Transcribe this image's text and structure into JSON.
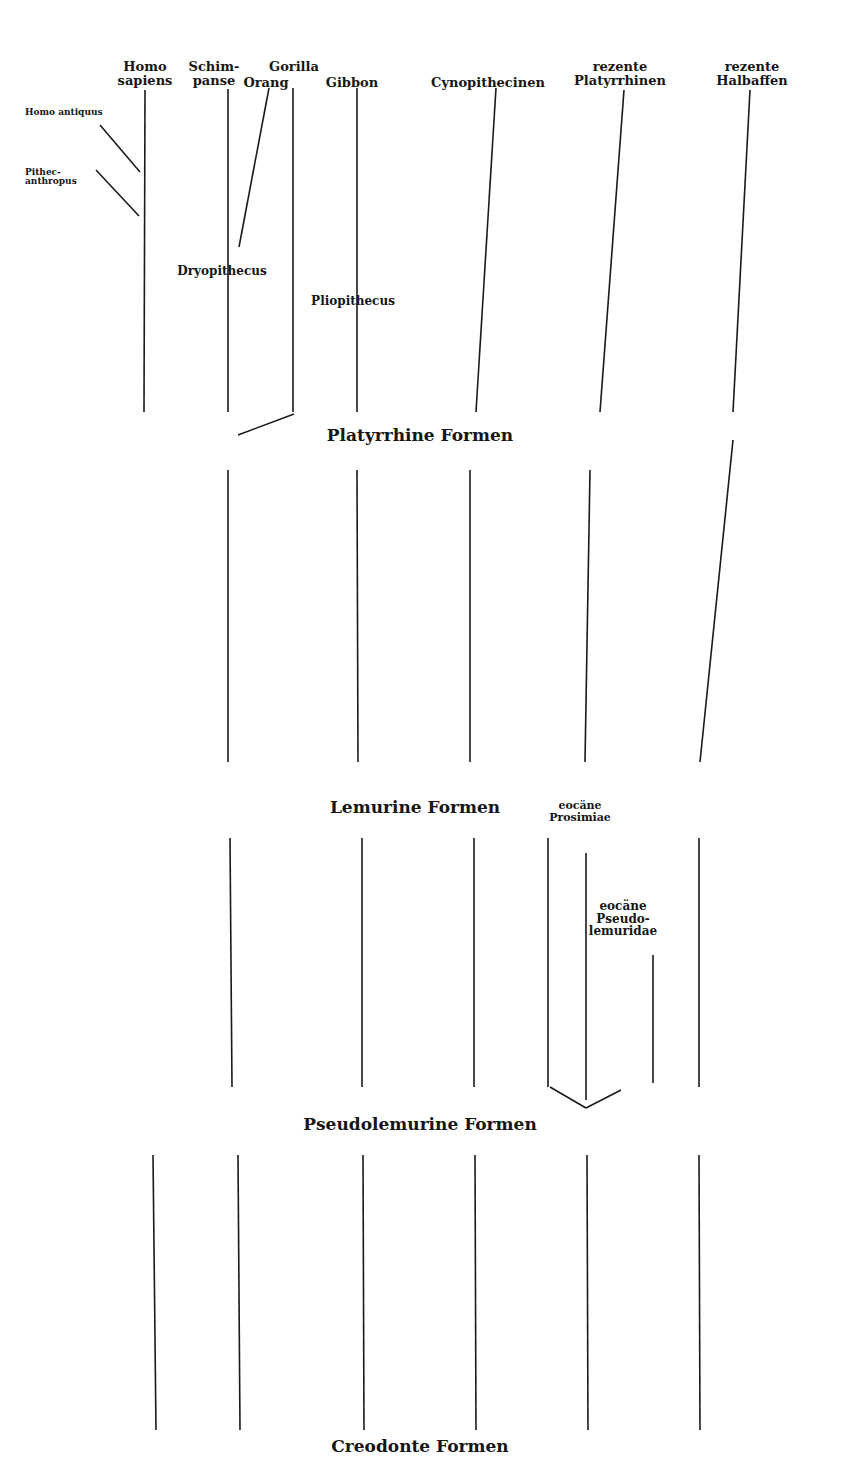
{
  "diagram": {
    "type": "phylogenetic-tree",
    "line_color": "#1a1a1a",
    "top_labels": [
      {
        "id": "homo-sapiens",
        "lines": [
          "Homo",
          "sapiens"
        ],
        "x": 145,
        "y": 60
      },
      {
        "id": "schimpanse",
        "lines": [
          "Schim-",
          "panse"
        ],
        "x": 214,
        "y": 60
      },
      {
        "id": "gorilla",
        "lines": [
          "Gorilla"
        ],
        "x": 294,
        "y": 60
      },
      {
        "id": "orang",
        "lines": [
          "Orang"
        ],
        "x": 266,
        "y": 76
      },
      {
        "id": "gibbon",
        "lines": [
          "Gibbon"
        ],
        "x": 352,
        "y": 76
      },
      {
        "id": "cynopithecinen",
        "lines": [
          "Cynopithecinen"
        ],
        "x": 488,
        "y": 76
      },
      {
        "id": "rezente-platyrrhinen",
        "lines": [
          "rezente",
          "Platyrrhinen"
        ],
        "x": 620,
        "y": 60
      },
      {
        "id": "rezente-halbaffen",
        "lines": [
          "rezente",
          "Halbaffen"
        ],
        "x": 752,
        "y": 60
      }
    ],
    "side_labels": [
      {
        "id": "homo-antiquus",
        "lines": [
          "Homo antiquus"
        ],
        "x": 45,
        "y": 108
      },
      {
        "id": "pithecanthropus",
        "lines": [
          "Pithec-",
          "anthropus"
        ],
        "x": 45,
        "y": 168
      }
    ],
    "mid_labels": [
      {
        "id": "dryopithecus",
        "lines": [
          "Dryopithecus"
        ],
        "x": 222,
        "y": 265
      },
      {
        "id": "pliopithecus",
        "lines": [
          "Pliopithecus"
        ],
        "x": 353,
        "y": 295
      },
      {
        "id": "eocaene-prosimiae",
        "lines": [
          "eocäne",
          "Prosimiae"
        ],
        "x": 580,
        "y": 800,
        "small": true
      },
      {
        "id": "eocaene-pseudolemuridae",
        "lines": [
          "eocäne",
          "Pseudo-",
          "lemuridae"
        ],
        "x": 623,
        "y": 900
      }
    ],
    "stage_labels": [
      {
        "id": "platyrrhine-formen",
        "text": "Platyrrhine Formen",
        "x": 420,
        "y": 427
      },
      {
        "id": "lemurine-formen",
        "text": "Lemurine Formen",
        "x": 415,
        "y": 799
      },
      {
        "id": "pseudolemurine-formen",
        "text": "Pseudolemurine Formen",
        "x": 420,
        "y": 1116
      },
      {
        "id": "creodonte-formen",
        "text": "Creodonte Formen",
        "x": 420,
        "y": 1438
      }
    ],
    "lines": [
      [
        145,
        90,
        144,
        412
      ],
      [
        228,
        89,
        228,
        412
      ],
      [
        293,
        88,
        293,
        412
      ],
      [
        357,
        88,
        357,
        412
      ],
      [
        496,
        88,
        476,
        412
      ],
      [
        624,
        90,
        600,
        412
      ],
      [
        750,
        90,
        733,
        412
      ],
      [
        100,
        125,
        140,
        172
      ],
      [
        96,
        170,
        139,
        216
      ],
      [
        269,
        88,
        239,
        247
      ],
      [
        238,
        435,
        294,
        414
      ],
      [
        228,
        470,
        228,
        762
      ],
      [
        357,
        470,
        358,
        762
      ],
      [
        470,
        470,
        470,
        762
      ],
      [
        590,
        470,
        585,
        762
      ],
      [
        733,
        440,
        700,
        762
      ],
      [
        230,
        838,
        232,
        1087
      ],
      [
        362,
        838,
        362,
        1087
      ],
      [
        474,
        838,
        474,
        1087
      ],
      [
        548,
        838,
        548,
        1087
      ],
      [
        586,
        853,
        586,
        1100
      ],
      [
        653,
        955,
        653,
        1083
      ],
      [
        699,
        838,
        699,
        1087
      ],
      [
        550,
        1087,
        586,
        1108
      ],
      [
        586,
        1108,
        621,
        1090
      ],
      [
        153,
        1155,
        156,
        1430
      ],
      [
        238,
        1155,
        240,
        1430
      ],
      [
        363,
        1155,
        364,
        1430
      ],
      [
        475,
        1155,
        476,
        1430
      ],
      [
        587,
        1155,
        588,
        1430
      ],
      [
        699,
        1155,
        700,
        1430
      ]
    ]
  }
}
